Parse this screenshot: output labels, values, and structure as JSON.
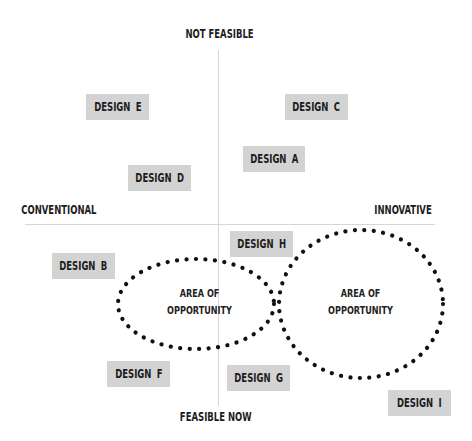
{
  "axes": {
    "top": "NOT FEASIBLE",
    "bottom": "FEASIBLE NOW",
    "left": "CONVENTIONAL",
    "right": "INNOVATIVE"
  },
  "designs": [
    {
      "id": "E",
      "label": "DESIGN E",
      "quadrant": "conventional-not-feasible"
    },
    {
      "id": "C",
      "label": "DESIGN C",
      "quadrant": "innovative-not-feasible"
    },
    {
      "id": "A",
      "label": "DESIGN A",
      "quadrant": "innovative-not-feasible"
    },
    {
      "id": "D",
      "label": "DESIGN D",
      "quadrant": "conventional-not-feasible"
    },
    {
      "id": "H",
      "label": "DESIGN H",
      "quadrant": "innovative-feasible"
    },
    {
      "id": "B",
      "label": "DESIGN B",
      "quadrant": "conventional-feasible"
    },
    {
      "id": "F",
      "label": "DESIGN F",
      "quadrant": "conventional-feasible"
    },
    {
      "id": "G",
      "label": "DESIGN G",
      "quadrant": "innovative-feasible"
    },
    {
      "id": "I",
      "label": "DESIGN I",
      "quadrant": "innovative-feasible"
    }
  ],
  "areas": [
    {
      "line1": "AREA OF",
      "line2": "OPPORTUNITY"
    },
    {
      "line1": "AREA OF",
      "line2": "OPPORTUNITY"
    }
  ],
  "colors": {
    "box_fill": "#d3d3d3",
    "text": "#1c1c1c",
    "axis": "#d6d6d6",
    "dots": "#111111"
  }
}
